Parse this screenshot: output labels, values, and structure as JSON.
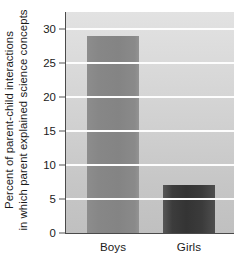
{
  "chart_data": {
    "type": "bar",
    "title": "",
    "xlabel": "",
    "ylabel_lines": [
      "Percent of parent-child interactions",
      "in which parent explained science concepts"
    ],
    "categories": [
      "Boys",
      "Girls"
    ],
    "values": [
      29,
      7
    ],
    "series": [
      {
        "name": "Percent of parent-child interactions in which parent explained science concepts",
        "values": [
          29,
          7
        ]
      }
    ],
    "ylim": [
      0,
      32.5
    ],
    "yticks": [
      0,
      5,
      10,
      15,
      20,
      25,
      30
    ],
    "ytick_labels": [
      "0",
      "5",
      "10",
      "15",
      "20",
      "25",
      "30"
    ],
    "grid": true,
    "gridline_color": "#fdfdfd",
    "legend": "none",
    "bar_colors": [
      "#878787",
      "#3a3a3a"
    ],
    "plot_background": "#d4d4d4",
    "axis_color": "#4a4a4a",
    "text_color": "#1a1a1a"
  }
}
